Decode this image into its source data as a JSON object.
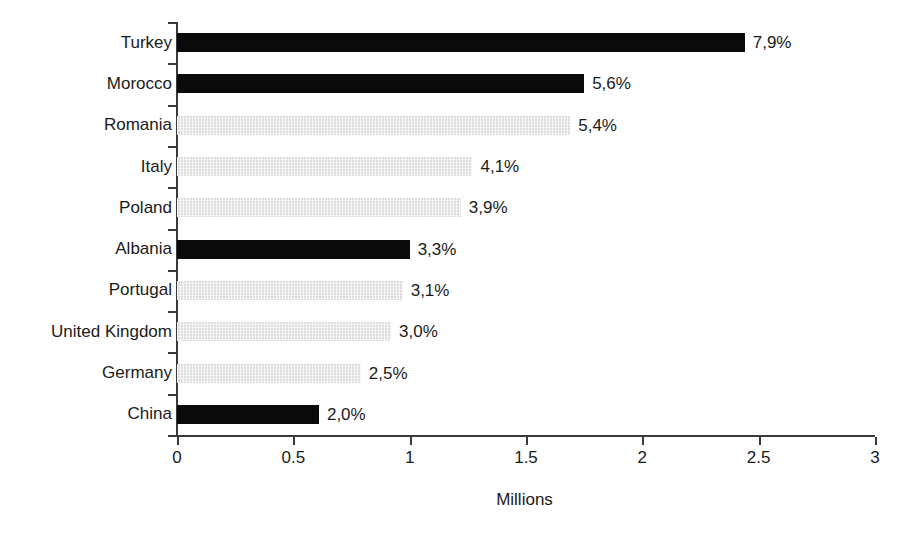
{
  "chart_data": {
    "type": "bar",
    "orientation": "horizontal",
    "title": "",
    "subtitle": "",
    "xlabel": "Millions",
    "ylabel": "",
    "xlim": [
      0,
      3
    ],
    "xticks": [
      "0",
      "0.5",
      "1",
      "1.5",
      "2",
      "2.5",
      "3"
    ],
    "xtick_values": [
      0,
      0.5,
      1,
      1.5,
      2,
      2.5,
      3
    ],
    "grid": false,
    "legend": "none",
    "categories": [
      "Turkey",
      "Morocco",
      "Romania",
      "Italy",
      "Poland",
      "Albania",
      "Portugal",
      "United Kingdom",
      "Germany",
      "China"
    ],
    "values": [
      2.44,
      1.75,
      1.69,
      1.27,
      1.22,
      1.0,
      0.97,
      0.92,
      0.79,
      0.61
    ],
    "data_labels": [
      "7,9%",
      "5,6%",
      "5,4%",
      "4,1%",
      "3,9%",
      "3,3%",
      "3,1%",
      "3,0%",
      "2,5%",
      "2,0%"
    ],
    "bar_styles": [
      "dark",
      "dark",
      "light",
      "light",
      "light",
      "dark",
      "light",
      "light",
      "light",
      "dark"
    ],
    "colors": {
      "dark": "#0b0b0b",
      "light": "#dcdcdc",
      "axis": "#3a3a3a",
      "text": "#1a1a1a",
      "background": "#ffffff"
    }
  }
}
